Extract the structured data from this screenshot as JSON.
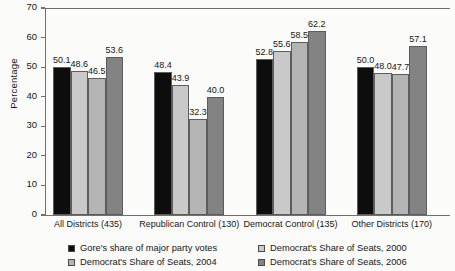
{
  "chart_data": {
    "type": "bar",
    "title": "",
    "xlabel": "",
    "ylabel": "Percentage",
    "ylim": [
      0,
      70
    ],
    "yticks": [
      0,
      10,
      20,
      30,
      40,
      50,
      60,
      70
    ],
    "grid": false,
    "legend_position": "bottom",
    "categories": [
      "All Districts (435)",
      "Republican Control (130)",
      "Democrat Control (135)",
      "Other Districts (170)"
    ],
    "series": [
      {
        "name": "Gore's share of major party votes",
        "color": "#0d0d0d",
        "values": [
          50.1,
          48.4,
          52.8,
          50.0
        ],
        "labels": [
          "50.1",
          "48.4",
          "52.8",
          "50.0"
        ]
      },
      {
        "name": "Democrat's Share of Seats, 2000",
        "color": "#c9c9c9",
        "values": [
          48.6,
          43.9,
          55.6,
          48.0
        ],
        "labels": [
          "48.6",
          "43.9",
          "55.6",
          "48.0"
        ]
      },
      {
        "name": "Democrat's Share of Seats, 2004",
        "color": "#b4b4b4",
        "values": [
          46.5,
          32.3,
          58.5,
          47.7
        ],
        "labels": [
          "46.5",
          "32.3",
          "58.5",
          "47.7"
        ]
      },
      {
        "name": "Democrat's Share of Seats, 2006",
        "color": "#838383",
        "values": [
          53.6,
          40.0,
          62.2,
          57.1
        ],
        "labels": [
          "53.6",
          "40.0",
          "62.2",
          "57.1"
        ]
      }
    ]
  }
}
